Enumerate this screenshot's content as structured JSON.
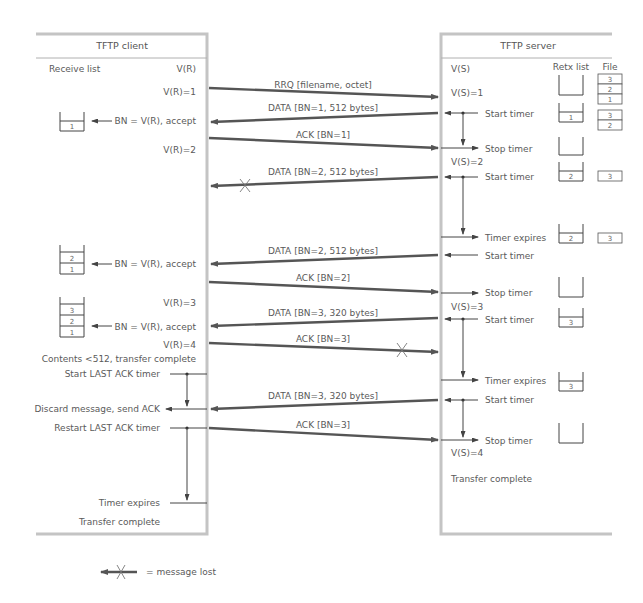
{
  "client": {
    "title": "TFTP client",
    "receive_list_label": "Receive list",
    "vr_label": "V(R)",
    "events": [
      {
        "id": "vr1",
        "text": "V(R)=1"
      },
      {
        "id": "accept1",
        "text": "BN = V(R), accept"
      },
      {
        "id": "vr2",
        "text": "V(R)=2"
      },
      {
        "id": "accept2",
        "text": "BN = V(R), accept"
      },
      {
        "id": "vr3",
        "text": "V(R)=3"
      },
      {
        "id": "accept3",
        "text": "BN = V(R), accept"
      },
      {
        "id": "vr4",
        "text": "V(R)=4"
      },
      {
        "id": "contents",
        "text": "Contents <512, transfer complete"
      },
      {
        "id": "start_last_ack",
        "text": "Start LAST ACK timer"
      },
      {
        "id": "discard",
        "text": "Discard message, send ACK"
      },
      {
        "id": "restart_last_ack",
        "text": "Restart LAST ACK timer"
      },
      {
        "id": "timer_expires",
        "text": "Timer expires"
      },
      {
        "id": "transfer_complete",
        "text": "Transfer complete"
      }
    ],
    "receive_lists": [
      {
        "cells": [
          "1"
        ]
      },
      {
        "cells": [
          "2",
          "1"
        ]
      },
      {
        "cells": [
          "3",
          "2",
          "1"
        ]
      }
    ]
  },
  "server": {
    "title": "TFTP server",
    "vs_label": "V(S)",
    "retx_list_label": "Retx list",
    "file_label": "File",
    "events": [
      {
        "id": "vs1",
        "text": "V(S)=1"
      },
      {
        "id": "start1",
        "text": "Start timer"
      },
      {
        "id": "stop1",
        "text": "Stop timer"
      },
      {
        "id": "vs2",
        "text": "V(S)=2"
      },
      {
        "id": "start2",
        "text": "Start timer"
      },
      {
        "id": "expire2",
        "text": "Timer expires"
      },
      {
        "id": "start2b",
        "text": "Start timer"
      },
      {
        "id": "stop2",
        "text": "Stop timer"
      },
      {
        "id": "vs3",
        "text": "V(S)=3"
      },
      {
        "id": "start3",
        "text": "Start timer"
      },
      {
        "id": "expire3",
        "text": "Timer expires"
      },
      {
        "id": "start3b",
        "text": "Start timer"
      },
      {
        "id": "stop3",
        "text": "Stop timer"
      },
      {
        "id": "vs4",
        "text": "V(S)=4"
      },
      {
        "id": "transfer_complete",
        "text": "Transfer complete"
      }
    ],
    "retx_lists": [
      {
        "cells": []
      },
      {
        "cells": [
          "1"
        ]
      },
      {
        "cells": []
      },
      {
        "cells": [
          "2"
        ]
      },
      {
        "cells": [
          "2"
        ]
      },
      {
        "cells": []
      },
      {
        "cells": [
          "3"
        ]
      },
      {
        "cells": [
          "3"
        ]
      },
      {
        "cells": []
      }
    ],
    "file_stacks": [
      {
        "cells": [
          "3",
          "2",
          "1"
        ]
      },
      {
        "cells": [
          "3",
          "2"
        ]
      },
      {
        "cells": [
          "3"
        ]
      },
      {
        "cells": [
          "3"
        ]
      }
    ]
  },
  "messages": [
    {
      "label": "RRQ [filename, octet]",
      "direction": "client-to-server",
      "lost": false
    },
    {
      "label": "DATA [BN=1, 512 bytes]",
      "direction": "server-to-client",
      "lost": false
    },
    {
      "label": "ACK [BN=1]",
      "direction": "client-to-server",
      "lost": false
    },
    {
      "label": "DATA [BN=2, 512 bytes]",
      "direction": "server-to-client",
      "lost": true
    },
    {
      "label": "DATA [BN=2, 512 bytes]",
      "direction": "server-to-client",
      "lost": false
    },
    {
      "label": "ACK [BN=2]",
      "direction": "client-to-server",
      "lost": false
    },
    {
      "label": "DATA [BN=3, 320 bytes]",
      "direction": "server-to-client",
      "lost": false
    },
    {
      "label": "ACK [BN=3]",
      "direction": "client-to-server",
      "lost": true
    },
    {
      "label": "DATA [BN=3, 320 bytes]",
      "direction": "server-to-client",
      "lost": false
    },
    {
      "label": "ACK [BN=3]",
      "direction": "client-to-server",
      "lost": false
    }
  ],
  "legend": {
    "lost_label": "= message lost"
  },
  "colors": {
    "box_border": "#c4c4c4",
    "arrow": "#555555",
    "text": "#5a5a5a"
  }
}
